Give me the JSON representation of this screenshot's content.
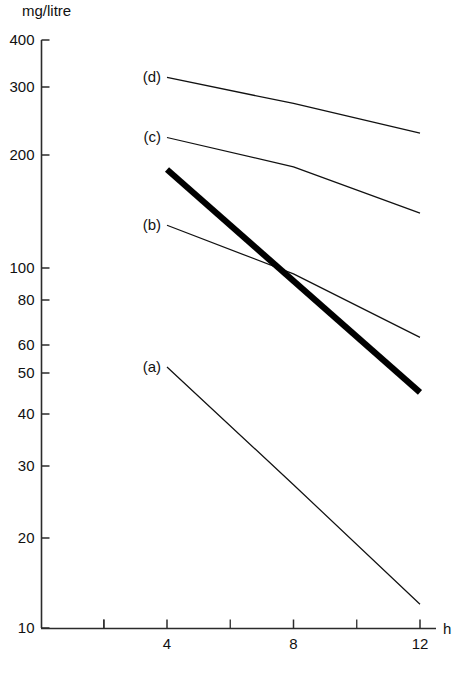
{
  "chart_data": {
    "type": "line",
    "title": "",
    "xlabel": "h",
    "ylabel": "mg/litre",
    "yscale": "log",
    "ylim": [
      10,
      400
    ],
    "xlim": [
      0,
      14
    ],
    "grid": false,
    "legend_position": "inline-left-labels",
    "y_ticks": [
      {
        "value": 400,
        "label": "400"
      },
      {
        "value": 300,
        "label": "300"
      },
      {
        "value": 200,
        "label": "200"
      },
      {
        "value": 100,
        "label": "100"
      },
      {
        "value": 80,
        "label": "80"
      },
      {
        "value": 60,
        "label": "60"
      },
      {
        "value": 50,
        "label": "50"
      },
      {
        "value": 40,
        "label": "40"
      },
      {
        "value": 30,
        "label": "30"
      },
      {
        "value": 20,
        "label": "20"
      },
      {
        "value": 10,
        "label": "10"
      }
    ],
    "x_ticks": [
      {
        "value": 2,
        "label": ""
      },
      {
        "value": 4,
        "label": "4"
      },
      {
        "value": 6,
        "label": ""
      },
      {
        "value": 8,
        "label": "8"
      },
      {
        "value": 10,
        "label": ""
      },
      {
        "value": 12,
        "label": "12"
      }
    ],
    "series": [
      {
        "name": "(a)",
        "label": "(a)",
        "style": "thin",
        "x": [
          4,
          8,
          12
        ],
        "values": [
          52,
          27,
          12
        ]
      },
      {
        "name": "(b)",
        "label": "(b)",
        "style": "thin",
        "x": [
          4,
          8,
          12
        ],
        "values": [
          130,
          96,
          63
        ]
      },
      {
        "name": "(c)",
        "label": "(c)",
        "style": "thin",
        "x": [
          4,
          8,
          12
        ],
        "values": [
          222,
          186,
          140
        ]
      },
      {
        "name": "(d)",
        "label": "(d)",
        "style": "thin",
        "x": [
          4,
          8,
          12
        ],
        "values": [
          318,
          272,
          228
        ]
      },
      {
        "name": "bold-line",
        "label": "",
        "style": "bold",
        "x": [
          4,
          12
        ],
        "values": [
          183,
          45
        ]
      }
    ]
  },
  "axes": {
    "y_axis_title": "mg/litre",
    "x_axis_title": "h"
  }
}
